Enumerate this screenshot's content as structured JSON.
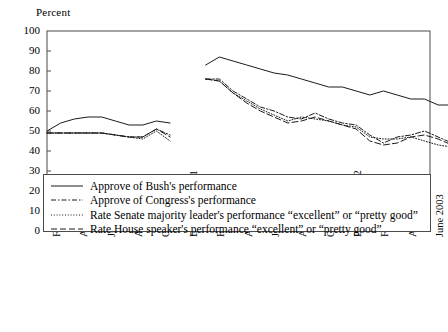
{
  "chart_data": {
    "type": "line",
    "title": "",
    "ylabel": "Percent",
    "xlabel": "",
    "ylim": [
      0,
      100
    ],
    "ytick_labels": [
      "0",
      "10",
      "20",
      "30",
      "40",
      "50",
      "60",
      "70",
      "80",
      "90",
      "100"
    ],
    "ytick_values": [
      0,
      10,
      20,
      30,
      40,
      50,
      60,
      70,
      80,
      90,
      100
    ],
    "grid": false,
    "legend_position": "inside-bottom-left",
    "x": [
      "February 2001",
      "March 2001",
      "April 2001",
      "May 2001",
      "June 2001",
      "July 2001",
      "August 2001",
      "September 2001",
      "October 2001",
      "November 2001",
      "December 2001",
      "January 2002",
      "February 2002",
      "March 2002",
      "April 2002",
      "May 2002",
      "June 2002",
      "July 2002",
      "August 2002",
      "September 2002",
      "October 2002",
      "November 2002",
      "December 2002",
      "January 2003",
      "February 2003",
      "March 2003",
      "April 2003",
      "May 2003",
      "June 2003"
    ],
    "xtick_labels": [
      "February 2001",
      "April 2001",
      "June 2001",
      "August 2001",
      "October 2001",
      "December 2001",
      "February 2002",
      "April 2002",
      "June 2002",
      "August 2002",
      "October 2002",
      "December 2002",
      "February 2003",
      "April 2003",
      "June 2003"
    ],
    "xtick_indices": [
      0,
      2,
      4,
      6,
      8,
      10,
      12,
      14,
      16,
      18,
      20,
      22,
      24,
      26,
      28
    ],
    "series": [
      {
        "name": "Approve of Bush's performance",
        "style": "solid",
        "segments": [
          {
            "x_start": 0,
            "values": [
              50,
              54,
              56,
              57,
              57,
              55,
              53,
              53,
              55,
              54
            ]
          },
          {
            "x_start": 11.6,
            "values": [
              83,
              87,
              85,
              83,
              81,
              79,
              78,
              76,
              74,
              72,
              72,
              70,
              68,
              70,
              68,
              66,
              66,
              63,
              63,
              63,
              71,
              68,
              64
            ]
          }
        ]
      },
      {
        "name": "Approve of Congress's performance",
        "style": "dashdot",
        "segments": [
          {
            "x_start": 0,
            "values": [
              49,
              49,
              49,
              49,
              49,
              48,
              47,
              47,
              51,
              48
            ]
          },
          {
            "x_start": 11.6,
            "values": [
              76,
              76,
              70,
              66,
              62,
              60,
              57,
              56,
              59,
              56,
              54,
              53,
              48,
              44,
              47,
              48,
              50,
              47,
              44,
              44,
              41,
              45,
              49,
              41,
              45,
              40
            ]
          }
        ]
      },
      {
        "name": "Rate Senate majority leader's performance “excellent” or “pretty good”",
        "style": "dotted",
        "segments": [
          {
            "x_start": 0,
            "values": [
              49,
              49,
              49,
              49,
              49,
              48,
              47,
              46,
              50,
              45
            ]
          },
          {
            "x_start": 11.6,
            "values": [
              76,
              75,
              69,
              65,
              61,
              58,
              55,
              57,
              56,
              55,
              53,
              52,
              47,
              46,
              46,
              47,
              45,
              43,
              42,
              40,
              38,
              36,
              39,
              41,
              40,
              36
            ]
          }
        ]
      },
      {
        "name": "Rate House speaker's performance “excellent” or “pretty good”",
        "style": "longdash",
        "segments": [
          {
            "x_start": 0,
            "values": [
              49,
              49,
              49,
              49,
              49,
              48,
              47,
              47,
              51,
              47
            ]
          },
          {
            "x_start": 11.6,
            "values": [
              76,
              75,
              69,
              64,
              60,
              57,
              54,
              55,
              57,
              55,
              53,
              51,
              45,
              43,
              44,
              47,
              48,
              46,
              43,
              42,
              39,
              43,
              47,
              39,
              43,
              38
            ]
          }
        ]
      }
    ]
  },
  "legend": {
    "entries": [
      {
        "label": "Approve of Bush's performance",
        "style": "solid"
      },
      {
        "label": "Approve of Congress's performance",
        "style": "dashdot"
      },
      {
        "label": "Rate Senate majority leader's performance “excellent” or “pretty good”",
        "style": "dotted"
      },
      {
        "label": "Rate House speaker's performance “excellent” or “pretty good”",
        "style": "longdash"
      }
    ]
  },
  "colors": {
    "line": "#1a1a1a",
    "axis": "#4a4a4a",
    "text": "#000000",
    "background": "#ffffff"
  }
}
